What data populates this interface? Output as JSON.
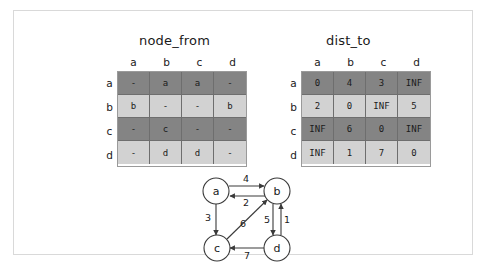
{
  "figure": {
    "panels": [
      {
        "id": "node_from",
        "title": "node_from"
      },
      {
        "id": "dist_to",
        "title": "dist_to"
      }
    ]
  },
  "node_from_table": {
    "title": "node_from",
    "column_headers": [
      "a",
      "b",
      "c",
      "d"
    ],
    "row_headers": [
      "a",
      "b",
      "c",
      "d"
    ],
    "row_shades": [
      "dark",
      "light",
      "dark",
      "light"
    ],
    "rows": [
      [
        "-",
        "a",
        "a",
        "-"
      ],
      [
        "b",
        "-",
        "-",
        "b"
      ],
      [
        "-",
        "c",
        "-",
        "-"
      ],
      [
        "-",
        "d",
        "d",
        "-"
      ]
    ]
  },
  "dist_to_table": {
    "title": "dist_to",
    "column_headers": [
      "a",
      "b",
      "c",
      "d"
    ],
    "row_headers": [
      "a",
      "b",
      "c",
      "d"
    ],
    "row_shades": [
      "dark",
      "light",
      "dark",
      "light"
    ],
    "rows": [
      [
        "0",
        "4",
        "3",
        "INF"
      ],
      [
        "2",
        "0",
        "INF",
        "5"
      ],
      [
        "INF",
        "6",
        "0",
        "INF"
      ],
      [
        "INF",
        "1",
        "7",
        "0"
      ]
    ]
  },
  "graph": {
    "nodes": [
      {
        "id": "a",
        "label": "a",
        "cx": 32,
        "cy": 20
      },
      {
        "id": "b",
        "label": "b",
        "cx": 93,
        "cy": 20
      },
      {
        "id": "c",
        "label": "c",
        "cx": 33,
        "cy": 77
      },
      {
        "id": "d",
        "label": "d",
        "cx": 93,
        "cy": 77
      }
    ],
    "edges": [
      {
        "from": "a",
        "to": "b",
        "weight": "4",
        "label_x": 62,
        "label_y": 10
      },
      {
        "from": "b",
        "to": "a",
        "weight": "2",
        "label_x": 62,
        "label_y": 32
      },
      {
        "from": "a",
        "to": "c",
        "weight": "3",
        "label_x": 23,
        "label_y": 46
      },
      {
        "from": "c",
        "to": "b",
        "weight": "6",
        "label_x": 58,
        "label_y": 53
      },
      {
        "from": "b",
        "to": "d",
        "weight": "5",
        "label_x": 84,
        "label_y": 50
      },
      {
        "from": "d",
        "to": "b",
        "weight": "1",
        "label_x": 100,
        "label_y": 50
      },
      {
        "from": "d",
        "to": "c",
        "weight": "7",
        "label_x": 63,
        "label_y": 85
      }
    ]
  },
  "colors": {
    "row_dark": "#848484",
    "row_light": "#d2d2d2",
    "grid_border": "#6e6e6e",
    "frame_border": "#d9d9d9",
    "stroke": "#3a3a3a",
    "text": "#1a1a1a"
  }
}
